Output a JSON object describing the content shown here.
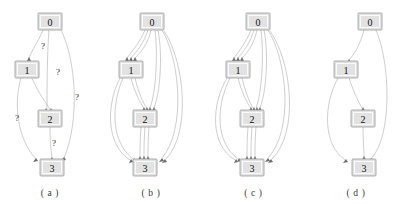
{
  "figure": {
    "width": 407,
    "height": 204,
    "background": "#ffffff",
    "node_fill": "#e2e2e2",
    "node_stroke": "#9a9a9a",
    "edge_color": "#b9b9b9",
    "arrow_color": "#6d6d6d",
    "label_color": "#111111"
  },
  "panels": [
    {
      "id": "a",
      "caption": "( a )",
      "x": 0,
      "width": 100,
      "nodes": [
        {
          "id": "n0",
          "label": "0",
          "cx": 50,
          "cy": 21
        },
        {
          "id": "n1",
          "label": "1",
          "cx": 27,
          "cy": 69
        },
        {
          "id": "n2",
          "label": "2",
          "cx": 50,
          "cy": 118
        },
        {
          "id": "n3",
          "label": "3",
          "cx": 52,
          "cy": 166
        }
      ],
      "edges": [
        {
          "from": "0",
          "to": "1",
          "label": "?"
        },
        {
          "from": "0",
          "to": "2",
          "label": "?"
        },
        {
          "from": "0",
          "to": "3",
          "label": "?"
        },
        {
          "from": "1",
          "to": "2",
          "label": ""
        },
        {
          "from": "1",
          "to": "3",
          "label": "?"
        },
        {
          "from": "2",
          "to": "3",
          "label": "?"
        }
      ],
      "edge_labels": [
        "?",
        "?",
        "?",
        "?",
        "?"
      ]
    },
    {
      "id": "b",
      "caption": "( b )",
      "x": 100,
      "width": 102,
      "nodes": [
        {
          "id": "n0",
          "label": "0",
          "cx": 152,
          "cy": 21
        },
        {
          "id": "n1",
          "label": "1",
          "cx": 131,
          "cy": 69
        },
        {
          "id": "n2",
          "label": "2",
          "cx": 145,
          "cy": 118
        },
        {
          "id": "n3",
          "label": "3",
          "cx": 145,
          "cy": 166
        }
      ],
      "edges": [
        {
          "from": "0",
          "to": "1",
          "label": ""
        },
        {
          "from": "0",
          "to": "1",
          "label": ""
        },
        {
          "from": "0",
          "to": "1",
          "label": ""
        },
        {
          "from": "0",
          "to": "2",
          "label": ""
        },
        {
          "from": "0",
          "to": "2",
          "label": ""
        },
        {
          "from": "0",
          "to": "3",
          "label": ""
        },
        {
          "from": "0",
          "to": "3",
          "label": ""
        },
        {
          "from": "1",
          "to": "2",
          "label": ""
        },
        {
          "from": "1",
          "to": "2",
          "label": ""
        },
        {
          "from": "1",
          "to": "3",
          "label": ""
        },
        {
          "from": "1",
          "to": "3",
          "label": ""
        },
        {
          "from": "2",
          "to": "3",
          "label": ""
        },
        {
          "from": "2",
          "to": "3",
          "label": ""
        },
        {
          "from": "2",
          "to": "3",
          "label": ""
        }
      ],
      "edge_labels": []
    },
    {
      "id": "c",
      "caption": "( c )",
      "x": 202,
      "width": 103,
      "nodes": [
        {
          "id": "n0",
          "label": "0",
          "cx": 258,
          "cy": 21
        },
        {
          "id": "n1",
          "label": "1",
          "cx": 238,
          "cy": 69
        },
        {
          "id": "n2",
          "label": "2",
          "cx": 251,
          "cy": 118
        },
        {
          "id": "n3",
          "label": "3",
          "cx": 253,
          "cy": 166
        }
      ],
      "edges": [
        {
          "from": "0",
          "to": "1",
          "label": ""
        },
        {
          "from": "0",
          "to": "1",
          "label": ""
        },
        {
          "from": "0",
          "to": "1",
          "label": ""
        },
        {
          "from": "0",
          "to": "2",
          "label": ""
        },
        {
          "from": "0",
          "to": "2",
          "label": ""
        },
        {
          "from": "0",
          "to": "3",
          "label": ""
        },
        {
          "from": "0",
          "to": "3",
          "label": ""
        },
        {
          "from": "1",
          "to": "2",
          "label": ""
        },
        {
          "from": "1",
          "to": "2",
          "label": ""
        },
        {
          "from": "1",
          "to": "3",
          "label": ""
        },
        {
          "from": "1",
          "to": "3",
          "label": ""
        },
        {
          "from": "2",
          "to": "3",
          "label": ""
        },
        {
          "from": "2",
          "to": "3",
          "label": ""
        },
        {
          "from": "2",
          "to": "3",
          "label": ""
        }
      ],
      "edge_labels": []
    },
    {
      "id": "d",
      "caption": "( d )",
      "x": 305,
      "width": 102,
      "nodes": [
        {
          "id": "n0",
          "label": "0",
          "cx": 370,
          "cy": 21
        },
        {
          "id": "n1",
          "label": "1",
          "cx": 346,
          "cy": 69
        },
        {
          "id": "n2",
          "label": "2",
          "cx": 363,
          "cy": 118
        },
        {
          "id": "n3",
          "label": "3",
          "cx": 365,
          "cy": 166
        }
      ],
      "edges": [
        {
          "from": "0",
          "to": "1",
          "label": ""
        },
        {
          "from": "0",
          "to": "3",
          "label": ""
        },
        {
          "from": "1",
          "to": "2",
          "label": ""
        },
        {
          "from": "1",
          "to": "3",
          "label": ""
        },
        {
          "from": "2",
          "to": "3",
          "label": ""
        }
      ],
      "edge_labels": []
    }
  ]
}
